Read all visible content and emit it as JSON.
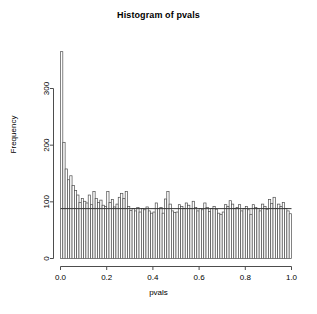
{
  "chart_data": {
    "type": "bar",
    "title": "Histogram of pvals",
    "xlabel": "pvals",
    "ylabel": "Frequency",
    "xlim": [
      0.0,
      1.0
    ],
    "ylim": [
      0,
      380
    ],
    "grid": false,
    "legend": null,
    "bin_width": 0.01,
    "x_ticks": [
      "0.0",
      "0.2",
      "0.4",
      "0.6",
      "0.8",
      "1.0"
    ],
    "x_tick_values": [
      0.0,
      0.2,
      0.4,
      0.6,
      0.8,
      1.0
    ],
    "y_ticks": [
      "0",
      "100",
      "200",
      "300"
    ],
    "y_tick_values": [
      0,
      100,
      200,
      300
    ],
    "annotations": [
      {
        "kind": "horizontal-reference-line",
        "y_value": 88,
        "label": "uniform null level"
      }
    ],
    "bar_fill": "#ffffff",
    "bar_stroke": "#4d4d4d",
    "axis_color": "#4d4d4d",
    "categories": [
      "0.00",
      "0.01",
      "0.02",
      "0.03",
      "0.04",
      "0.05",
      "0.06",
      "0.07",
      "0.08",
      "0.09",
      "0.10",
      "0.11",
      "0.12",
      "0.13",
      "0.14",
      "0.15",
      "0.16",
      "0.17",
      "0.18",
      "0.19",
      "0.20",
      "0.21",
      "0.22",
      "0.23",
      "0.24",
      "0.25",
      "0.26",
      "0.27",
      "0.28",
      "0.29",
      "0.30",
      "0.31",
      "0.32",
      "0.33",
      "0.34",
      "0.35",
      "0.36",
      "0.37",
      "0.38",
      "0.39",
      "0.40",
      "0.41",
      "0.42",
      "0.43",
      "0.44",
      "0.45",
      "0.46",
      "0.47",
      "0.48",
      "0.49",
      "0.50",
      "0.51",
      "0.52",
      "0.53",
      "0.54",
      "0.55",
      "0.56",
      "0.57",
      "0.58",
      "0.59",
      "0.60",
      "0.61",
      "0.62",
      "0.63",
      "0.64",
      "0.65",
      "0.66",
      "0.67",
      "0.68",
      "0.69",
      "0.70",
      "0.71",
      "0.72",
      "0.73",
      "0.74",
      "0.75",
      "0.76",
      "0.77",
      "0.78",
      "0.79",
      "0.80",
      "0.81",
      "0.82",
      "0.83",
      "0.84",
      "0.85",
      "0.86",
      "0.87",
      "0.88",
      "0.89",
      "0.90",
      "0.91",
      "0.92",
      "0.93",
      "0.94",
      "0.95",
      "0.96",
      "0.97",
      "0.98",
      "0.99"
    ],
    "values": [
      365,
      205,
      158,
      139,
      146,
      129,
      120,
      112,
      99,
      106,
      101,
      98,
      112,
      95,
      118,
      106,
      99,
      103,
      94,
      92,
      118,
      99,
      104,
      91,
      96,
      108,
      115,
      106,
      118,
      92,
      85,
      88,
      84,
      90,
      82,
      88,
      86,
      91,
      84,
      80,
      82,
      98,
      88,
      90,
      80,
      105,
      118,
      96,
      84,
      81,
      82,
      95,
      92,
      88,
      98,
      94,
      88,
      101,
      90,
      84,
      88,
      86,
      98,
      90,
      83,
      88,
      92,
      87,
      80,
      78,
      82,
      95,
      92,
      102,
      96,
      88,
      90,
      95,
      84,
      88,
      92,
      86,
      78,
      95,
      90,
      88,
      84,
      96,
      92,
      87,
      104,
      97,
      108,
      88,
      96,
      92,
      99,
      88,
      84,
      79
    ]
  }
}
